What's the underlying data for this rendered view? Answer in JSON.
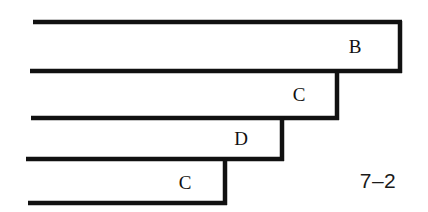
{
  "figure": {
    "caption": "7–2",
    "stroke_color": "#111111",
    "background_color": "#ffffff",
    "stroke_width": 4,
    "width": 428,
    "height": 212,
    "labels": [
      {
        "text": "B",
        "x": 355,
        "y": 46
      },
      {
        "text": "C",
        "x": 299,
        "y": 94
      },
      {
        "text": "D",
        "x": 241,
        "y": 138
      },
      {
        "text": "C",
        "x": 185,
        "y": 182
      }
    ],
    "steps": [
      {
        "name": "B",
        "left": 33,
        "top": 22,
        "right": 400,
        "bottom": 71
      },
      {
        "name": "C",
        "left": 30,
        "top": 71,
        "right": 337,
        "bottom": 118
      },
      {
        "name": "D",
        "left": 31,
        "top": 118,
        "right": 282,
        "bottom": 159
      },
      {
        "name": "C",
        "left": 26,
        "top": 159,
        "right": 225,
        "bottom": 203
      }
    ],
    "caption_position": {
      "x": 378,
      "y": 180
    }
  }
}
